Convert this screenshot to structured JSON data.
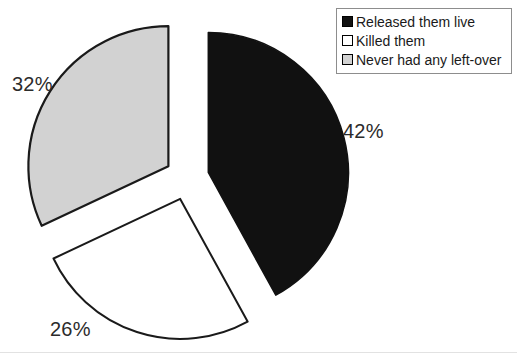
{
  "chart_data": {
    "type": "pie",
    "title": "",
    "labels": [
      "Released them live",
      "Killed them",
      "Never had any left-over"
    ],
    "values": [
      42,
      26,
      32
    ],
    "value_labels": [
      "42%",
      "26%",
      "32%"
    ],
    "units": "percent",
    "exploded": true,
    "legend_position": "top-right",
    "grid": false,
    "colors": [
      "#111111",
      "#ffffff",
      "#d2d2d2"
    ],
    "edge_color": "#1a1a1a",
    "slices": [
      {
        "label": "Released them live",
        "value": 42,
        "value_label": "42%",
        "color": "#111111",
        "start_angle_deg": 0,
        "end_angle_deg": 151.2
      },
      {
        "label": "Killed them",
        "value": 26,
        "value_label": "26%",
        "color": "#ffffff",
        "start_angle_deg": 151.2,
        "end_angle_deg": 244.8
      },
      {
        "label": "Never had any left-over",
        "value": 32,
        "value_label": "32%",
        "color": "#d2d2d2",
        "start_angle_deg": 244.8,
        "end_angle_deg": 360
      }
    ]
  },
  "legend": {
    "items": [
      {
        "label": "Released them live",
        "swatch_color": "#111111"
      },
      {
        "label": "Killed them",
        "swatch_color": "#ffffff"
      },
      {
        "label": "Never had any left-over",
        "swatch_color": "#d2d2d2"
      }
    ]
  },
  "labels": {
    "black_pct": "42%",
    "white_pct": "26%",
    "gray_pct": "32%"
  },
  "colors": {
    "background": "#ffffff",
    "black_slice": "#111111",
    "white_slice": "#ffffff",
    "gray_slice": "#d2d2d2",
    "outline": "#1a1a1a",
    "legend_border": "#8d8d8d",
    "text": "#1a1a1a"
  }
}
